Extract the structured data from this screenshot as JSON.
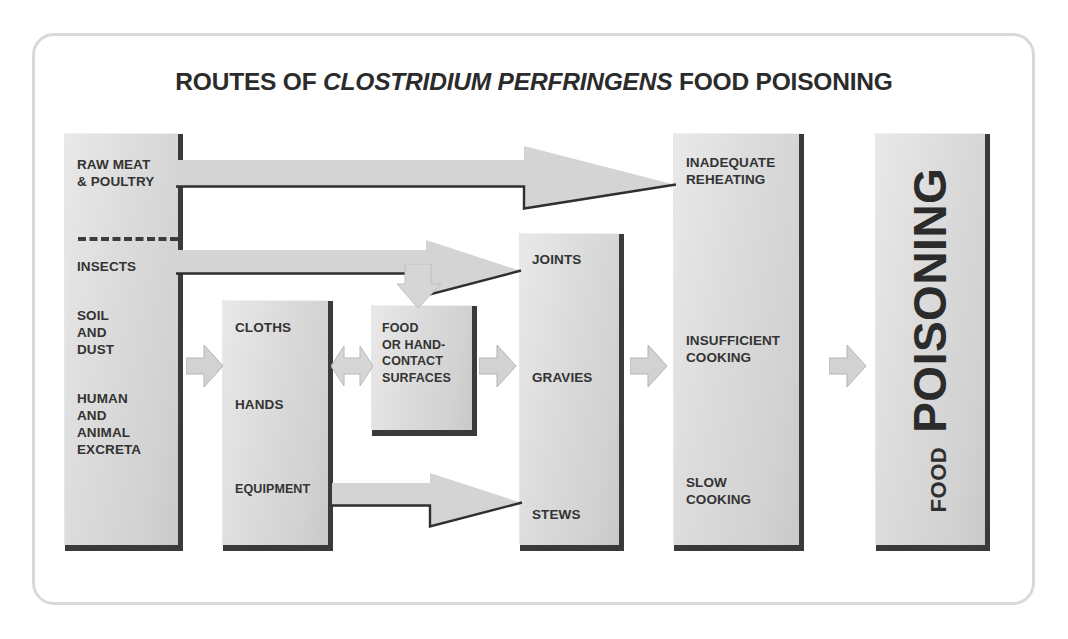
{
  "diagram": {
    "title_prefix": "ROUTES OF ",
    "title_italic": "CLOSTRIDIUM PERFRINGENS",
    "title_suffix": " FOOD POISONING",
    "colors": {
      "frame_border": "#d9d9d9",
      "box_fill_light": "#e9e9e9",
      "box_fill_dark": "#c9c9c9",
      "box_shadow": "#3a3a3a",
      "text": "#333333",
      "arrow_fill": "#d4d4d4",
      "arrow_outline": "#2b2b2b"
    },
    "boxes": {
      "sources": {
        "name": "sources-box",
        "items": [
          "RAW MEAT\n& POULTRY",
          "INSECTS",
          "SOIL\nAND\nDUST",
          "HUMAN\nAND\nANIMAL\nEXCRETA"
        ]
      },
      "cloths": {
        "name": "cloths-hands-equipment-box",
        "items": [
          "CLOTHS",
          "HANDS",
          "EQUIPMENT"
        ]
      },
      "surfaces": {
        "name": "food-or-hand-contact-surfaces-box",
        "items": [
          "FOOD\nOR HAND-\nCONTACT\nSURFACES"
        ]
      },
      "foods": {
        "name": "foods-box",
        "items": [
          "JOINTS",
          "GRAVIES",
          "STEWS"
        ]
      },
      "cooking": {
        "name": "cooking-faults-box",
        "items": [
          "INADEQUATE\nREHEATING",
          "INSUFFICIENT\nCOOKING",
          "SLOW\nCOOKING"
        ]
      },
      "poisoning": {
        "name": "food-poisoning-box",
        "small": "FOOD",
        "big": "POISONING"
      }
    },
    "arrows": {
      "raw_meat_to_reheating": "raw-meat-to-inadequate-reheating-arrow",
      "insects_to_joints": "insects-to-joints-arrow",
      "branch_to_surfaces": "branch-down-to-surfaces-arrow",
      "equipment_to_stews": "equipment-to-stews-arrow",
      "sources_to_cloths": "sources-to-cloths-arrow",
      "cloths_to_surfaces": "cloths-to-surfaces-bidirectional-arrow",
      "surfaces_to_foods": "surfaces-to-foods-arrow",
      "foods_to_cooking": "foods-to-cooking-arrow",
      "cooking_to_poisoning": "cooking-to-poisoning-arrow"
    }
  }
}
